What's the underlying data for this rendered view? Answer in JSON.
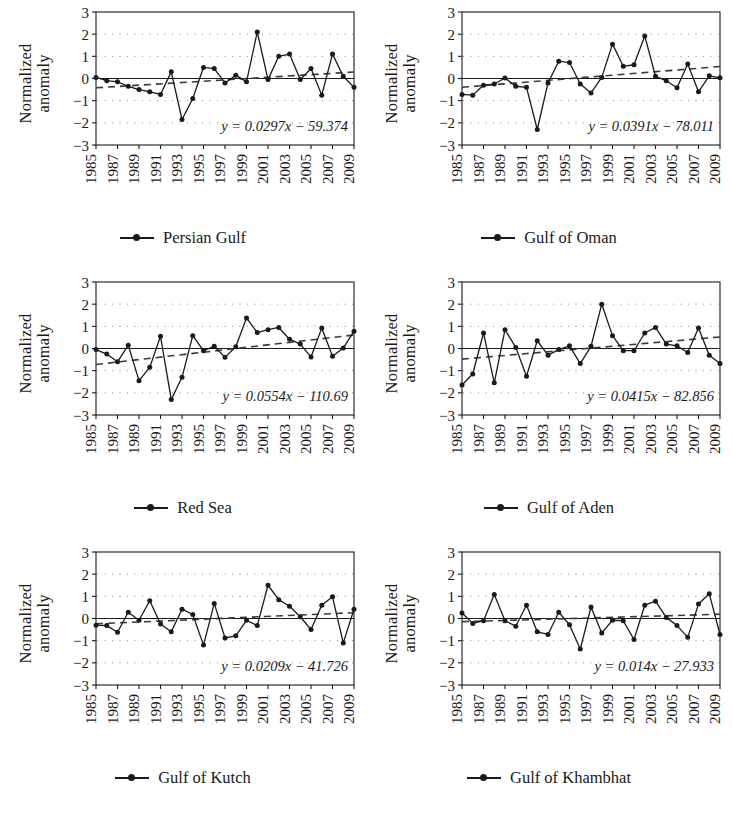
{
  "figure": {
    "y_axis_label_line1": "Normalized",
    "y_axis_label_line2": "anomaly",
    "y_ticks": [
      "3",
      "2",
      "1",
      "0",
      "−1",
      "−2",
      "−3"
    ],
    "x_ticks": [
      "1985",
      "1987",
      "1989",
      "1991",
      "1993",
      "1995",
      "1997",
      "1999",
      "2001",
      "2003",
      "2005",
      "2007",
      "2009"
    ],
    "series_color": "#1a1a1a",
    "trend_color": "#3a3a3a",
    "grid_color": "#8a8a8a",
    "axis_color": "#1a1a1a"
  },
  "chart_data": [
    {
      "type": "line",
      "title": "Persian Gulf",
      "legend_label": "Persian Gulf",
      "xlabel": "",
      "ylabel": "Normalized anomaly",
      "ylim": [
        -3,
        3
      ],
      "xlim": [
        1985,
        2009
      ],
      "grid": true,
      "annotation": "y = 0.0297x − 59.374",
      "trend": {
        "slope": 0.0297,
        "intercept": -59.374
      },
      "x": [
        1985,
        1986,
        1987,
        1988,
        1989,
        1990,
        1991,
        1992,
        1993,
        1994,
        1995,
        1996,
        1997,
        1998,
        1999,
        2000,
        2001,
        2002,
        2003,
        2004,
        2005,
        2006,
        2007,
        2008,
        2009
      ],
      "values": [
        0.05,
        -0.1,
        -0.15,
        -0.35,
        -0.5,
        -0.6,
        -0.72,
        0.3,
        -1.85,
        -0.9,
        0.5,
        0.45,
        -0.2,
        0.15,
        -0.15,
        2.1,
        -0.05,
        1.0,
        1.1,
        -0.05,
        0.45,
        -0.75,
        1.1,
        0.1,
        -0.4
      ]
    },
    {
      "type": "line",
      "title": "Gulf of Oman",
      "legend_label": "Gulf of Oman",
      "xlabel": "",
      "ylabel": "Normalized anomaly",
      "ylim": [
        -3,
        3
      ],
      "xlim": [
        1985,
        2009
      ],
      "grid": true,
      "annotation": "y = 0.0391x − 78.011",
      "trend": {
        "slope": 0.0391,
        "intercept": -78.011
      },
      "x": [
        1985,
        1986,
        1987,
        1988,
        1989,
        1990,
        1991,
        1992,
        1993,
        1994,
        1995,
        1996,
        1997,
        1998,
        1999,
        2000,
        2001,
        2002,
        2003,
        2004,
        2005,
        2006,
        2007,
        2008,
        2009
      ],
      "values": [
        -0.72,
        -0.75,
        -0.3,
        -0.25,
        0.02,
        -0.35,
        -0.4,
        -2.3,
        -0.2,
        0.78,
        0.72,
        -0.25,
        -0.65,
        0.05,
        1.55,
        0.55,
        0.62,
        1.92,
        0.1,
        -0.1,
        -0.42,
        0.65,
        -0.6,
        0.12,
        0.03
      ]
    },
    {
      "type": "line",
      "title": "Red Sea",
      "legend_label": "Red Sea",
      "xlabel": "",
      "ylabel": "Normalized anomaly",
      "ylim": [
        -3,
        3
      ],
      "xlim": [
        1985,
        2009
      ],
      "grid": true,
      "annotation": "y = 0.0554x − 110.69",
      "trend": {
        "slope": 0.0554,
        "intercept": -110.69
      },
      "x": [
        1985,
        1986,
        1987,
        1988,
        1989,
        1990,
        1991,
        1992,
        1993,
        1994,
        1995,
        1996,
        1997,
        1998,
        1999,
        2000,
        2001,
        2002,
        2003,
        2004,
        2005,
        2006,
        2007,
        2008,
        2009
      ],
      "values": [
        -0.05,
        -0.25,
        -0.6,
        0.15,
        -1.45,
        -0.85,
        0.55,
        -2.3,
        -1.3,
        0.58,
        -0.1,
        0.1,
        -0.4,
        0.08,
        1.38,
        0.72,
        0.85,
        0.95,
        0.42,
        0.2,
        -0.38,
        0.92,
        -0.35,
        0.02,
        0.78
      ]
    },
    {
      "type": "line",
      "title": "Gulf of Aden",
      "legend_label": "Gulf of Aden",
      "xlabel": "",
      "ylabel": "Normalized anomaly",
      "ylim": [
        -3,
        3
      ],
      "xlim": [
        1985,
        2009
      ],
      "grid": true,
      "annotation": "y = 0.0415x − 82.856",
      "trend": {
        "slope": 0.0415,
        "intercept": -82.856
      },
      "x": [
        1985,
        1986,
        1987,
        1988,
        1989,
        1990,
        1991,
        1992,
        1993,
        1994,
        1995,
        1996,
        1997,
        1998,
        1999,
        2000,
        2001,
        2002,
        2003,
        2004,
        2005,
        2006,
        2007,
        2008,
        2009
      ],
      "values": [
        -1.65,
        -1.15,
        0.7,
        -1.55,
        0.85,
        0.05,
        -1.25,
        0.35,
        -0.3,
        -0.05,
        0.12,
        -0.68,
        0.1,
        2.0,
        0.58,
        -0.1,
        -0.1,
        0.7,
        0.95,
        0.2,
        0.12,
        -0.18,
        0.92,
        -0.3,
        -0.68
      ]
    },
    {
      "type": "line",
      "title": "Gulf of Kutch",
      "legend_label": "Gulf of Kutch",
      "xlabel": "",
      "ylabel": "Normalized anomaly",
      "ylim": [
        -3,
        3
      ],
      "xlim": [
        1985,
        2009
      ],
      "grid": true,
      "annotation": "y = 0.0209x − 41.726",
      "trend": {
        "slope": 0.0209,
        "intercept": -41.726
      },
      "x": [
        1985,
        1986,
        1987,
        1988,
        1989,
        1990,
        1991,
        1992,
        1993,
        1994,
        1995,
        1996,
        1997,
        1998,
        1999,
        2000,
        2001,
        2002,
        2003,
        2004,
        2005,
        2006,
        2007,
        2008,
        2009
      ],
      "values": [
        -0.3,
        -0.32,
        -0.62,
        0.28,
        -0.08,
        0.8,
        -0.25,
        -0.6,
        0.42,
        0.18,
        -1.2,
        0.68,
        -0.88,
        -0.78,
        -0.08,
        -0.32,
        1.5,
        0.85,
        0.55,
        0.08,
        -0.5,
        0.6,
        0.98,
        -1.1,
        0.42
      ]
    },
    {
      "type": "line",
      "title": "Gulf of Khambhat",
      "legend_label": "Gulf of Khambhat",
      "xlabel": "",
      "ylabel": "Normalized anomaly",
      "ylim": [
        -3,
        3
      ],
      "xlim": [
        1985,
        2009
      ],
      "grid": true,
      "annotation": "y = 0.014x − 27.933",
      "trend": {
        "slope": 0.014,
        "intercept": -27.933
      },
      "x": [
        1985,
        1986,
        1987,
        1988,
        1989,
        1990,
        1991,
        1992,
        1993,
        1994,
        1995,
        1996,
        1997,
        1998,
        1999,
        2000,
        2001,
        2002,
        2003,
        2004,
        2005,
        2006,
        2007,
        2008,
        2009
      ],
      "values": [
        0.25,
        -0.22,
        -0.1,
        1.08,
        -0.1,
        -0.35,
        0.6,
        -0.6,
        -0.72,
        0.28,
        -0.28,
        -1.38,
        0.52,
        -0.65,
        -0.08,
        -0.1,
        -0.95,
        0.6,
        0.78,
        0.05,
        -0.32,
        -0.85,
        0.65,
        1.12,
        -0.72,
        1.5
      ]
    }
  ]
}
